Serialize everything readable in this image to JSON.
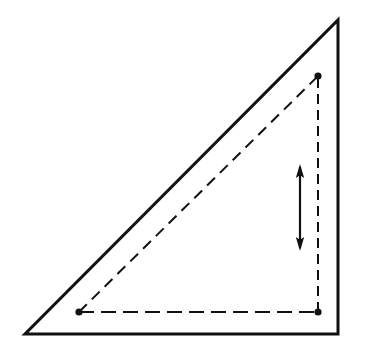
{
  "canvas": {
    "width": 368,
    "height": 360,
    "background": "#ffffff",
    "title": "Right triangle with inscribed dashed rectangle and vertical double-headed arrow"
  },
  "style": {
    "stroke_color": "#111111",
    "outer_stroke_width": 3,
    "dashed_stroke_width": 2,
    "arrow_stroke_width": 2,
    "vertex_dot_radius": 3.6,
    "dash_pattern_horizontal": "15 7",
    "dash_pattern_vertical": "10 6",
    "dash_pattern_diagonal": "11 7"
  },
  "outer_triangle": {
    "name": "outer-right-triangle",
    "points": "25,334 338,334 338,20",
    "vertices": [
      {
        "label": "bottom-left",
        "x": 25,
        "y": 334
      },
      {
        "label": "bottom-right",
        "x": 338,
        "y": 334
      },
      {
        "label": "apex-top-right",
        "x": 338,
        "y": 20
      }
    ],
    "fill": "none"
  },
  "inner_shape": {
    "name": "inner-dashed-triangle",
    "horizontal_segment": {
      "x1": 79,
      "y1": 312,
      "x2": 318,
      "y2": 312
    },
    "vertical_segment": {
      "x1": 318,
      "y1": 312,
      "x2": 318,
      "y2": 76
    },
    "diagonal_segment": {
      "x1": 79,
      "y1": 312,
      "x2": 318,
      "y2": 76
    }
  },
  "points": [
    {
      "name": "point-upper-right",
      "x": 318,
      "y": 76
    },
    {
      "name": "point-lower-right",
      "x": 318,
      "y": 312
    },
    {
      "name": "point-lower-left",
      "x": 79,
      "y": 312
    }
  ],
  "arrow": {
    "name": "vertical-double-headed-arrow",
    "x": 300,
    "y_top": 165,
    "y_bottom": 250,
    "head_half_width": 3.6,
    "head_length": 11,
    "double_headed": true
  }
}
